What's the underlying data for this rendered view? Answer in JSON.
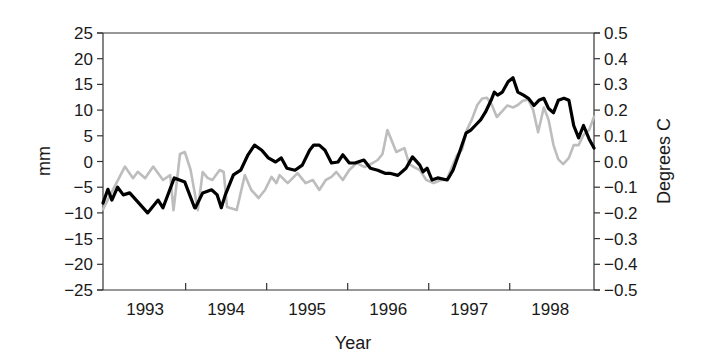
{
  "chart_data": {
    "type": "line",
    "title": "",
    "xlabel": "Year",
    "ylabel": "mm",
    "y2label": "Degrees C",
    "xlim": [
      1992.98,
      1999.04
    ],
    "ylim": [
      -25,
      25
    ],
    "y2lim": [
      -0.5,
      0.5
    ],
    "grid": false,
    "legend": null,
    "x_tick_labels": [
      "1993",
      "1994",
      "1995",
      "1996",
      "1997",
      "1998"
    ],
    "x_tick_positions": [
      1994.0,
      1995.0,
      1996.0,
      1997.0,
      1998.0
    ],
    "y_ticks": [
      25,
      20,
      15,
      10,
      5,
      0,
      -5,
      -10,
      -15,
      -20,
      -25
    ],
    "y2_ticks": [
      "0.5",
      "0.4",
      "0.3",
      "0.2",
      "0.1",
      "0.0",
      "-0.1",
      "-0.2",
      "-0.3",
      "-0.4",
      "-0.5"
    ],
    "series": [
      {
        "name": "Sea level (mm)",
        "axis": "left",
        "color": "#000000",
        "x": [
          1992.98,
          1993.04,
          1993.09,
          1993.16,
          1993.23,
          1993.31,
          1993.53,
          1993.66,
          1993.72,
          1993.86,
          1993.99,
          1994.11,
          1994.12,
          1994.21,
          1994.32,
          1994.39,
          1994.44,
          1994.49,
          1994.59,
          1994.68,
          1994.77,
          1994.85,
          1994.94,
          1995.02,
          1995.11,
          1995.18,
          1995.25,
          1995.35,
          1995.44,
          1995.53,
          1995.58,
          1995.65,
          1995.72,
          1995.8,
          1995.88,
          1995.94,
          1996.02,
          1996.09,
          1996.2,
          1996.28,
          1996.37,
          1996.46,
          1996.52,
          1996.62,
          1996.72,
          1996.8,
          1996.89,
          1996.93,
          1996.98,
          1997.04,
          1997.11,
          1997.23,
          1997.3,
          1997.38,
          1997.46,
          1997.52,
          1997.58,
          1997.64,
          1997.7,
          1997.77,
          1997.81,
          1997.85,
          1997.91,
          1997.98,
          1998.04,
          1998.1,
          1998.17,
          1998.23,
          1998.3,
          1998.36,
          1998.42,
          1998.48,
          1998.54,
          1998.6,
          1998.67,
          1998.73,
          1998.79,
          1998.85,
          1998.91,
          1998.98,
          1999.04
        ],
        "values": [
          -8.1,
          -5.4,
          -7.5,
          -5.0,
          -6.5,
          -6.1,
          -10.0,
          -7.5,
          -9.0,
          -3.2,
          -4.0,
          -9.0,
          -9.0,
          -6.1,
          -5.5,
          -6.5,
          -9.0,
          -6.5,
          -2.6,
          -1.7,
          1.3,
          3.2,
          2.2,
          0.7,
          -0.1,
          0.7,
          -1.3,
          -1.7,
          -0.7,
          2.2,
          3.2,
          3.2,
          2.2,
          -0.3,
          -0.1,
          1.3,
          -0.3,
          -0.3,
          0.3,
          -1.3,
          -1.7,
          -2.3,
          -2.3,
          -2.7,
          -1.3,
          0.9,
          -0.7,
          -2.0,
          -1.3,
          -3.6,
          -3.2,
          -3.6,
          -1.7,
          1.8,
          5.5,
          6.1,
          7.1,
          8.1,
          9.6,
          11.9,
          13.5,
          12.9,
          13.5,
          15.5,
          16.3,
          13.5,
          12.9,
          12.3,
          10.9,
          11.9,
          12.3,
          10.3,
          9.5,
          11.9,
          12.3,
          11.9,
          7.0,
          4.6,
          7.0,
          4.4,
          2.6
        ]
      },
      {
        "name": "Temperature (Degrees C)",
        "axis": "right",
        "color": "#bdbdbd",
        "x": [
          1992.98,
          1993.07,
          1993.25,
          1993.35,
          1993.41,
          1993.5,
          1993.6,
          1993.72,
          1993.81,
          1993.85,
          1993.93,
          1993.99,
          1994.06,
          1994.15,
          1994.21,
          1994.27,
          1994.33,
          1994.42,
          1994.47,
          1994.51,
          1994.63,
          1994.73,
          1994.81,
          1994.9,
          1994.98,
          1995.06,
          1995.12,
          1995.16,
          1995.26,
          1995.38,
          1995.48,
          1995.57,
          1995.65,
          1995.73,
          1995.8,
          1995.86,
          1995.94,
          1996.02,
          1996.11,
          1996.21,
          1996.31,
          1996.37,
          1996.43,
          1996.49,
          1996.58,
          1996.6,
          1996.7,
          1996.76,
          1996.82,
          1996.89,
          1996.97,
          1997.06,
          1997.15,
          1997.22,
          1997.35,
          1997.41,
          1997.47,
          1997.53,
          1997.6,
          1997.66,
          1997.72,
          1997.78,
          1997.84,
          1997.9,
          1997.97,
          1998.04,
          1998.1,
          1998.16,
          1998.23,
          1998.29,
          1998.35,
          1998.42,
          1998.48,
          1998.54,
          1998.6,
          1998.66,
          1998.73,
          1998.79,
          1998.85,
          1998.91,
          1998.98,
          1999.04
        ],
        "values": [
          -0.186,
          -0.13,
          -0.02,
          -0.065,
          -0.04,
          -0.065,
          -0.02,
          -0.072,
          -0.053,
          -0.19,
          0.029,
          0.037,
          -0.031,
          -0.189,
          -0.041,
          -0.064,
          -0.072,
          -0.033,
          -0.041,
          -0.177,
          -0.189,
          -0.053,
          -0.111,
          -0.142,
          -0.111,
          -0.06,
          -0.084,
          -0.053,
          -0.084,
          -0.045,
          -0.084,
          -0.072,
          -0.111,
          -0.072,
          -0.06,
          -0.041,
          -0.072,
          -0.033,
          -0.006,
          -0.022,
          -0.006,
          0.006,
          0.029,
          0.122,
          0.052,
          0.037,
          0.052,
          -0.01,
          -0.022,
          -0.033,
          -0.072,
          -0.084,
          -0.072,
          -0.072,
          0.025,
          0.045,
          0.122,
          0.162,
          0.22,
          0.245,
          0.248,
          0.22,
          0.173,
          0.193,
          0.218,
          0.21,
          0.22,
          0.236,
          0.24,
          0.2,
          0.114,
          0.21,
          0.162,
          0.064,
          0.008,
          -0.01,
          0.014,
          0.064,
          0.064,
          0.103,
          0.122,
          0.174
        ]
      }
    ]
  }
}
